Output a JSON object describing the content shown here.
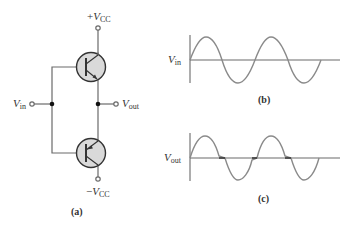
{
  "figure": {
    "circuit": {
      "caption": "(a)",
      "supply_positive": {
        "sign": "+",
        "symbol": "V",
        "subscript": "CC"
      },
      "supply_negative": {
        "sign": "−",
        "symbol": "V",
        "subscript": "CC"
      },
      "input": {
        "symbol": "V",
        "subscript": "in"
      },
      "output": {
        "symbol": "V",
        "subscript": "out"
      },
      "components": [
        "npn-transistor (top)",
        "pnp-transistor (bottom)"
      ],
      "colors": {
        "wire": "#6a6a6a",
        "transistor_fill": "#d9d9d9",
        "transistor_outline": "#333333"
      }
    },
    "waveform_input": {
      "caption": "(b)",
      "label": {
        "symbol": "V",
        "subscript": "in"
      },
      "description": "Sinusoidal input, two full cycles"
    },
    "waveform_output": {
      "caption": "(c)",
      "label": {
        "symbol": "V",
        "subscript": "out"
      },
      "description": "Sinusoidal output with crossover distortion flats at zero crossings"
    }
  }
}
